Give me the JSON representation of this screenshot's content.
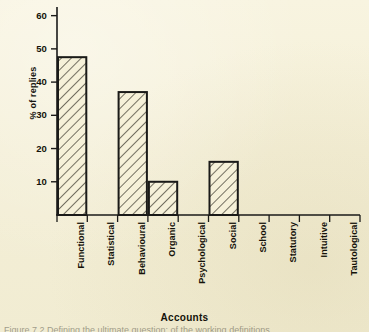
{
  "figure": {
    "background_color": "#f4efd7",
    "ink_color": "#1a1a18",
    "caption_partial": "Figure 7.2   Defining the ultimate question: of the working definitions ..."
  },
  "chart_data": {
    "type": "bar",
    "title": "",
    "xlabel": "Accounts",
    "ylabel": "% of  replies",
    "categories": [
      "Functional",
      "Statistical",
      "Behavioural",
      "Organic",
      "Psychological",
      "Social",
      "School",
      "Statutory",
      "Intuitive",
      "Tautological"
    ],
    "values": [
      47.5,
      0,
      37,
      10,
      0,
      16,
      0,
      0,
      0,
      0
    ],
    "ylim": [
      0,
      62
    ],
    "yticks": [
      10,
      20,
      30,
      40,
      50,
      60
    ],
    "ytick_labels": [
      "10",
      "20",
      "30",
      "40",
      "50",
      "60"
    ],
    "grid": false,
    "legend": "none",
    "bar_style": "diagonal-hatch",
    "bar_edge_color": "#1a1a18",
    "bar_fill_color": "#f6f1d9"
  }
}
